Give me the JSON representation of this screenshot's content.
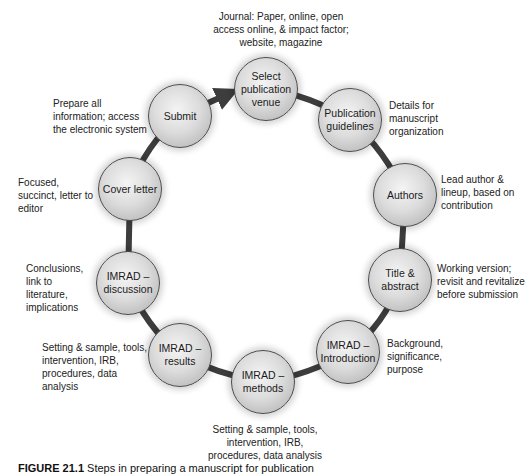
{
  "diagram": {
    "type": "cycle",
    "ring_color": "#4a4a4a",
    "nodes": [
      {
        "id": "select-venue",
        "label": "Select publication venue",
        "description": "Journal: Paper, online, open access online, & impact factor; website, magazine"
      },
      {
        "id": "publication-guidelines",
        "label": "Publication guidelines",
        "description": "Details for manuscript organization"
      },
      {
        "id": "authors",
        "label": "Authors",
        "description": "Lead author & lineup, based on contribution"
      },
      {
        "id": "title-abstract",
        "label": "Title & abstract",
        "description": "Working version; revisit and revitalize before submission"
      },
      {
        "id": "imrad-introduction",
        "label": "IMRAD – Introduction",
        "description": "Background, significance, purpose"
      },
      {
        "id": "imrad-methods",
        "label": "IMRAD – methods",
        "description": "Setting & sample, tools, intervention, IRB, procedures, data analysis"
      },
      {
        "id": "imrad-results",
        "label": "IMRAD – results",
        "description": "Setting & sample, tools, intervention, IRB, procedures, data analysis"
      },
      {
        "id": "imrad-discussion",
        "label": "IMRAD – discussion",
        "description": "Conclusions, link to literature, implications"
      },
      {
        "id": "cover-letter",
        "label": "Cover letter",
        "description": "Focused, succinct, letter to editor"
      },
      {
        "id": "submit",
        "label": "Submit",
        "description": "Prepare all information; access the electronic system"
      }
    ],
    "arrow": {
      "from": "submit",
      "to": "select-venue"
    }
  },
  "caption": {
    "number": "FIGURE 21.1",
    "text": "Steps in preparing a manuscript for publication"
  }
}
